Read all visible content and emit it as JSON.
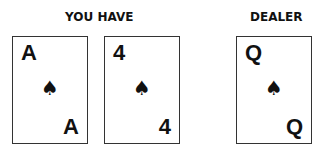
{
  "player": {
    "label": "YOU HAVE",
    "cards": [
      {
        "rank": "A",
        "suit": "♠",
        "suit_name": "spades"
      },
      {
        "rank": "4",
        "suit": "♠",
        "suit_name": "spades"
      }
    ]
  },
  "dealer": {
    "label": "DEALER",
    "cards": [
      {
        "rank": "Q",
        "suit": "♠",
        "suit_name": "spades"
      }
    ]
  }
}
